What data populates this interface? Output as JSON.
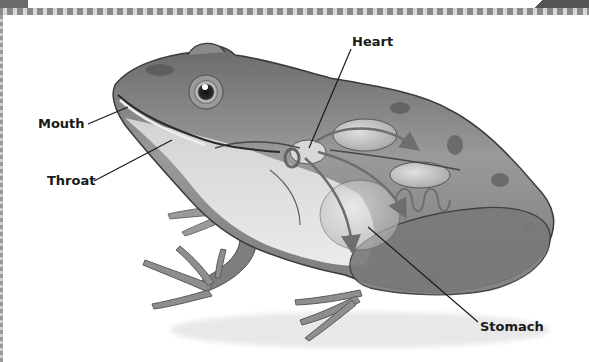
{
  "diagram": {
    "style": "grayscale illustration with leader-line labels",
    "labels": [
      {
        "id": "mouth",
        "text": "Mouth",
        "x": 38,
        "y": 117,
        "line": [
          88,
          124,
          128,
          107
        ]
      },
      {
        "id": "throat",
        "text": "Throat",
        "x": 47,
        "y": 174,
        "line": [
          94,
          181,
          172,
          140
        ]
      },
      {
        "id": "heart",
        "text": "Heart",
        "x": 352,
        "y": 35,
        "line": [
          351,
          49,
          309,
          148
        ]
      },
      {
        "id": "stomach",
        "text": "Stomach",
        "x": 480,
        "y": 320,
        "line": [
          368,
          227,
          478,
          322
        ]
      }
    ],
    "colors": {
      "background": "#ffffff",
      "skin_dark": "#5a5a5a",
      "skin_mid": "#8c8c8c",
      "skin_light": "#c4c4c4",
      "belly": "#e2e2e2",
      "organ": "#d0d0d0",
      "arrow": "#6e6e6e",
      "leader_line": "#1a1a1a",
      "label_text": "#1a1a1a",
      "border_dark": "#8a8a8a",
      "border_light": "#d8d8d8"
    }
  }
}
